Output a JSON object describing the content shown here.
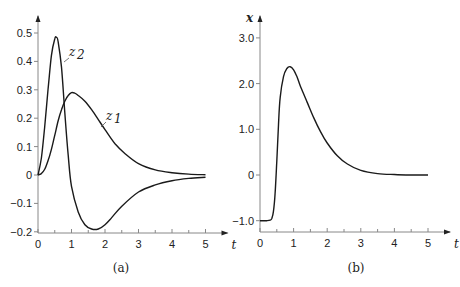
{
  "chart_data": [
    {
      "type": "line",
      "panel": "(a)",
      "caption": "(a)",
      "xlabel": "t",
      "ylabel": "",
      "xlim": [
        0,
        5
      ],
      "ylim": [
        -0.2,
        0.5
      ],
      "xticks": [
        "0",
        "1",
        "2",
        "3",
        "4",
        "5"
      ],
      "yticks": [
        "0.5",
        "0.4",
        "0.3",
        "0.2",
        "0.1",
        "0",
        "-0.1",
        "-0.2"
      ],
      "grid": false,
      "series": [
        {
          "name": "z2",
          "label": "z₂",
          "x": [
            0,
            0.1,
            0.2,
            0.3,
            0.4,
            0.5,
            0.55,
            0.6,
            0.7,
            0.8,
            0.9,
            1.0,
            1.2,
            1.4,
            1.6,
            1.8,
            2.0,
            2.2,
            2.5,
            3.0,
            3.5,
            4.0,
            4.5,
            5.0
          ],
          "y": [
            0,
            0.06,
            0.17,
            0.3,
            0.42,
            0.48,
            0.485,
            0.47,
            0.38,
            0.22,
            0.07,
            -0.04,
            -0.13,
            -0.175,
            -0.19,
            -0.19,
            -0.175,
            -0.15,
            -0.11,
            -0.06,
            -0.035,
            -0.02,
            -0.012,
            -0.008
          ]
        },
        {
          "name": "z1",
          "label": "z₁",
          "x": [
            0,
            0.1,
            0.2,
            0.3,
            0.4,
            0.5,
            0.6,
            0.7,
            0.8,
            0.9,
            1.0,
            1.1,
            1.2,
            1.4,
            1.6,
            1.8,
            2.0,
            2.3,
            2.6,
            3.0,
            3.5,
            4.0,
            4.5,
            5.0
          ],
          "y": [
            0,
            0.005,
            0.02,
            0.05,
            0.09,
            0.14,
            0.19,
            0.23,
            0.26,
            0.28,
            0.29,
            0.288,
            0.28,
            0.26,
            0.23,
            0.195,
            0.16,
            0.11,
            0.075,
            0.04,
            0.018,
            0.008,
            0.003,
            0.001
          ]
        }
      ]
    },
    {
      "type": "line",
      "panel": "(b)",
      "caption": "(b)",
      "xlabel": "t",
      "ylabel": "x",
      "xlim": [
        0,
        5
      ],
      "ylim": [
        -1.0,
        3.0
      ],
      "xticks": [
        "0",
        "1",
        "2",
        "3",
        "4",
        "5"
      ],
      "yticks": [
        "3.0",
        "2.0",
        "1.0",
        "0",
        "-1.0"
      ],
      "grid": false,
      "series": [
        {
          "name": "x",
          "x": [
            0,
            0.2,
            0.3,
            0.35,
            0.4,
            0.45,
            0.5,
            0.55,
            0.6,
            0.7,
            0.8,
            0.9,
            1.0,
            1.1,
            1.2,
            1.4,
            1.6,
            1.8,
            2.0,
            2.3,
            2.6,
            3.0,
            3.5,
            4.0,
            4.5,
            5.0
          ],
          "y": [
            -1.0,
            -1.0,
            -0.99,
            -0.95,
            -0.8,
            -0.4,
            0.3,
            1.1,
            1.7,
            2.15,
            2.33,
            2.37,
            2.3,
            2.15,
            1.95,
            1.6,
            1.25,
            0.95,
            0.7,
            0.42,
            0.24,
            0.1,
            0.03,
            0.01,
            0.0,
            0.0
          ]
        }
      ]
    }
  ]
}
